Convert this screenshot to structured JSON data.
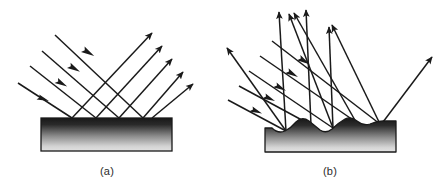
{
  "figure": {
    "background_color": "#ffffff",
    "ray_color": "#1a1a1a",
    "surface_outline_color": "#1a1a1a",
    "surface_gradient_top": "#1c1c1c",
    "surface_gradient_bottom": "#d8d8d8",
    "caption_color": "#2b2b2b"
  },
  "panels": [
    {
      "id": "panel-a",
      "caption": "(a)",
      "caption_x": 107,
      "caption_y": 175,
      "surface_type": "smooth",
      "reflection_type": "specular",
      "surface": {
        "x": 41,
        "y": 118,
        "width": 131,
        "height": 33
      },
      "incoming_rays": [
        {
          "x1": 18,
          "y1": 83,
          "x2": 72,
          "y2": 118,
          "head_t": 0.42
        },
        {
          "x1": 30,
          "y1": 66,
          "x2": 96,
          "y2": 118,
          "head_t": 0.4
        },
        {
          "x1": 42,
          "y1": 51,
          "x2": 119,
          "y2": 118,
          "head_t": 0.4
        },
        {
          "x1": 55,
          "y1": 35,
          "x2": 143,
          "y2": 118,
          "head_t": 0.4
        }
      ],
      "outgoing_rays": [
        {
          "x1": 72,
          "y1": 118,
          "x2": 152,
          "y2": 33
        },
        {
          "x1": 96,
          "y1": 118,
          "x2": 162,
          "y2": 46
        },
        {
          "x1": 119,
          "y1": 118,
          "x2": 172,
          "y2": 59
        },
        {
          "x1": 143,
          "y1": 118,
          "x2": 183,
          "y2": 72
        },
        {
          "x1": 152,
          "y1": 118,
          "x2": 193,
          "y2": 84
        }
      ]
    },
    {
      "id": "panel-b",
      "caption": "(b)",
      "caption_x": 330,
      "caption_y": 175,
      "surface_type": "rough",
      "reflection_type": "diffuse",
      "surface": {
        "x": 265,
        "y": 121,
        "width": 131,
        "height": 31
      },
      "bump_path": "M265,128 L272,128 Q278,134 285,131 Q291,128 296,122 Q302,116 309,121 Q314,125 320,130 Q326,134 332,129 Q338,123 345,119 Q351,116 357,121 Q363,126 370,124 Q377,121 383,121 L396,121 L396,152 L265,152 Z",
      "incoming_rays": [
        {
          "x1": 228,
          "y1": 100,
          "x2": 286,
          "y2": 131,
          "head_t": 0.44
        },
        {
          "x1": 239,
          "y1": 86,
          "x2": 311,
          "y2": 125,
          "head_t": 0.42
        },
        {
          "x1": 249,
          "y1": 71,
          "x2": 333,
          "y2": 128,
          "head_t": 0.42
        },
        {
          "x1": 260,
          "y1": 56,
          "x2": 356,
          "y2": 122,
          "head_t": 0.42
        },
        {
          "x1": 272,
          "y1": 41,
          "x2": 380,
          "y2": 124,
          "head_t": 0.42
        }
      ],
      "outgoing_rays": [
        {
          "x1": 286,
          "y1": 131,
          "x2": 227,
          "y2": 48
        },
        {
          "x1": 286,
          "y1": 131,
          "x2": 279,
          "y2": 12
        },
        {
          "x1": 311,
          "y1": 125,
          "x2": 306,
          "y2": 10
        },
        {
          "x1": 333,
          "y1": 128,
          "x2": 289,
          "y2": 14
        },
        {
          "x1": 333,
          "y1": 128,
          "x2": 329,
          "y2": 27
        },
        {
          "x1": 356,
          "y1": 122,
          "x2": 294,
          "y2": 13
        },
        {
          "x1": 380,
          "y1": 124,
          "x2": 332,
          "y2": 25
        },
        {
          "x1": 383,
          "y1": 122,
          "x2": 432,
          "y2": 57
        }
      ]
    }
  ]
}
